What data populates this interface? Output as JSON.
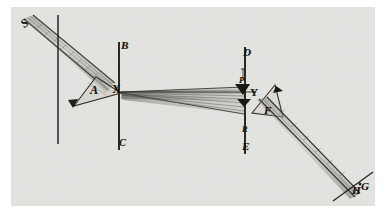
{
  "figure": {
    "kind": "optics-ray-diagram",
    "background_color": "#e3e3e0",
    "page_color": "#ffffff",
    "ink_color": "#16150f",
    "beam_color": "#4a4843",
    "width": 387,
    "height": 222
  },
  "labels": {
    "source": "S",
    "screen_top_1": "B",
    "screen_bottom_1": "C",
    "prism_1": "A",
    "aperture_1": "X",
    "screen_top_2": "D",
    "screen_bottom_2": "E",
    "aperture_2": "Y",
    "prism_2": "F",
    "marker_2": "R",
    "marker_1": "P",
    "target_h": "H",
    "target_g": "G"
  },
  "elements": {
    "incoming_beam": "beam-from-source-S",
    "left_board": "vertical-board-left",
    "first_screen": "vertical-screen-BC",
    "second_screen": "vertical-screen-DE",
    "first_prism": "prism-at-A",
    "second_prism": "prism-at-F",
    "spreading_beam": "beam-cone-X-to-Y",
    "exit_beam": "refracted-beam-to-HG",
    "target_screen": "screen-at-HG"
  }
}
